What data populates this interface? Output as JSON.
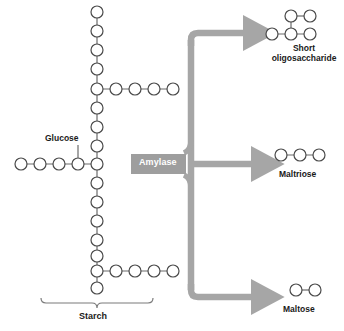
{
  "figure": {
    "background_color": "#ffffff"
  },
  "colors": {
    "circle_stroke": "#4a4a4a",
    "circle_fill": "#ffffff",
    "bond_line": "#6b6b6b",
    "arrow_gray": "#a6a6a6",
    "enzyme_box": "#9e9e9e",
    "enzyme_text": "#ffffff",
    "label_text": "#1a1a1a",
    "bracket": "#7a7a7a"
  },
  "substrate": {
    "name": "starch",
    "label": "Starch",
    "monomer_label": "Glucose",
    "backbone_count": 16,
    "branches": [
      {
        "id": "upper-branch",
        "direction": "right",
        "count": 4
      },
      {
        "id": "glucose-branch",
        "direction": "left",
        "count": 4
      },
      {
        "id": "lower-branch",
        "direction": "right",
        "count": 4
      }
    ]
  },
  "enzyme": {
    "name": "amylase",
    "label": "Amylase"
  },
  "products": [
    {
      "id": "short-oligosaccharide",
      "label": "Short oligosaccharide",
      "label_line1": "Short",
      "label_line2": "oligosaccharide",
      "unit_count": 5,
      "shape": "branched"
    },
    {
      "id": "maltriose",
      "label": "Maltriose",
      "unit_count": 3,
      "shape": "linear"
    },
    {
      "id": "maltose",
      "label": "Maltose",
      "unit_count": 2,
      "shape": "linear"
    }
  ],
  "arrows": [
    {
      "id": "arrow-to-short-oligosaccharide",
      "direction": "up-right"
    },
    {
      "id": "arrow-to-maltriose",
      "direction": "right"
    },
    {
      "id": "arrow-to-maltose",
      "direction": "down-right"
    }
  ]
}
